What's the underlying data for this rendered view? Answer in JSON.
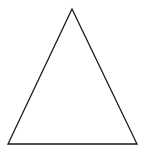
{
  "diagram": {
    "shape": "triangle",
    "type": "isosceles",
    "stroke_color": "#1a1a1a",
    "fill_color": "#ffffff",
    "background": "#ffffff",
    "stroke_width": 1.3,
    "vertices": {
      "apex": [
        72,
        9
      ],
      "bottom_left": [
        8,
        144
      ],
      "bottom_right": [
        137,
        144
      ]
    }
  }
}
